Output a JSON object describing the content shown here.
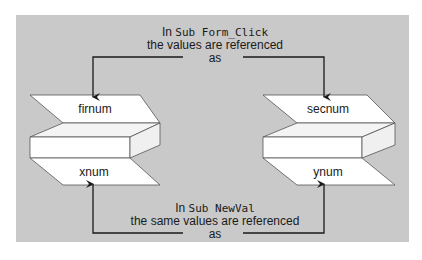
{
  "diagram": {
    "top_caption": {
      "prefix": "In",
      "code": "Sub Form_Click",
      "line2": "the values are referenced",
      "line3": "as"
    },
    "bottom_caption": {
      "prefix": "In",
      "code": "Sub NewVal",
      "line2": "the same values are referenced",
      "line3": "as"
    },
    "left_stack": {
      "top_label": "firnum",
      "bottom_label": "xnum"
    },
    "right_stack": {
      "top_label": "secnum",
      "bottom_label": "ynum"
    },
    "colors": {
      "background": "#c9c9c9",
      "shape_fill": "#ffffff",
      "line": "#1a1a1a"
    }
  }
}
